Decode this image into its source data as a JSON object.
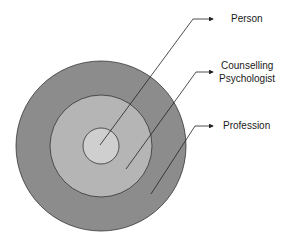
{
  "diagram": {
    "type": "concentric-circles",
    "layers": [
      {
        "name": "Person",
        "level": "inner",
        "color": "#cfcfcf"
      },
      {
        "name": "Counselling Psychologist",
        "level": "middle",
        "color": "#b5b5b5"
      },
      {
        "name": "Profession",
        "level": "outer",
        "color": "#8c8c8c"
      }
    ],
    "labels": {
      "person": "Person",
      "counselling_line1": "Counselling",
      "counselling_line2": "Psychologist",
      "profession": "Profession"
    }
  }
}
